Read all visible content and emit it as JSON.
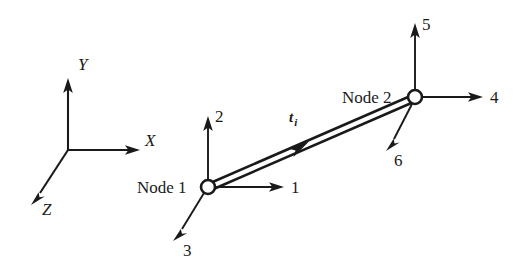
{
  "figure": {
    "background_color": "#ffffff",
    "ink_color": "#1a1a1a"
  },
  "global_axes": {
    "name": "global-coordinate-triad",
    "origin": {
      "x": 68,
      "y": 150
    },
    "axes": [
      {
        "id": "y-axis",
        "label": "Y",
        "tip": {
          "x": 68,
          "y": 80
        },
        "label_pos": {
          "x": 78,
          "y": 70
        },
        "direction": "up"
      },
      {
        "id": "x-axis",
        "label": "X",
        "tip": {
          "x": 138,
          "y": 150
        },
        "label_pos": {
          "x": 145,
          "y": 146
        },
        "direction": "right"
      },
      {
        "id": "z-axis",
        "label": "Z",
        "tip": {
          "x": 33,
          "y": 203
        },
        "label_pos": {
          "x": 42,
          "y": 215
        },
        "direction": "down-left"
      }
    ]
  },
  "element": {
    "name": "frame-element",
    "vector_label": "t",
    "vector_subscript": "i",
    "vector_label_pos": {
      "x": 295,
      "y": 120
    },
    "start": {
      "x": 208,
      "y": 187
    },
    "end": {
      "x": 415,
      "y": 97
    },
    "mid_arrow_at": {
      "x": 298,
      "y": 147
    }
  },
  "nodes": [
    {
      "id": "node-1",
      "label": "Node 1",
      "label_pos": {
        "x": 137,
        "y": 193
      },
      "center": {
        "x": 208,
        "y": 187
      },
      "radius": 7,
      "dofs": [
        {
          "number": "1",
          "direction": "right",
          "tip": {
            "x": 283,
            "y": 187
          },
          "label_pos": {
            "x": 291,
            "y": 193
          }
        },
        {
          "number": "2",
          "direction": "up",
          "tip": {
            "x": 208,
            "y": 118
          },
          "label_pos": {
            "x": 216,
            "y": 120
          }
        },
        {
          "number": "3",
          "direction": "down-left",
          "tip": {
            "x": 175,
            "y": 238
          },
          "label_pos": {
            "x": 183,
            "y": 255
          }
        }
      ]
    },
    {
      "id": "node-2",
      "label": "Node 2",
      "label_pos": {
        "x": 342,
        "y": 97
      },
      "center": {
        "x": 415,
        "y": 97
      },
      "radius": 7,
      "dofs": [
        {
          "number": "4",
          "direction": "right",
          "tip": {
            "x": 482,
            "y": 97
          },
          "label_pos": {
            "x": 490,
            "y": 103
          }
        },
        {
          "number": "5",
          "direction": "up",
          "tip": {
            "x": 415,
            "y": 25
          },
          "label_pos": {
            "x": 423,
            "y": 28
          }
        },
        {
          "number": "6",
          "direction": "down-left",
          "tip": {
            "x": 388,
            "y": 148
          },
          "label_pos": {
            "x": 394,
            "y": 165
          }
        }
      ]
    }
  ]
}
